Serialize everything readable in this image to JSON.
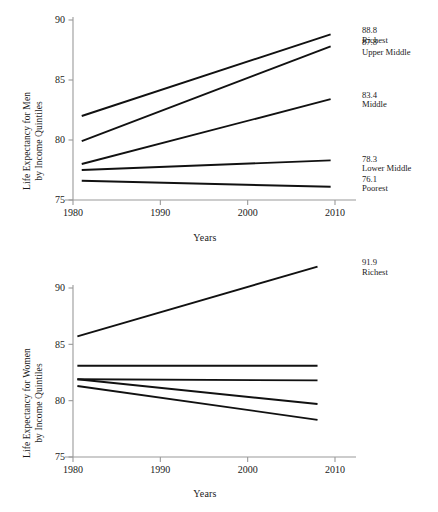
{
  "chart_data": [
    {
      "id": "men",
      "type": "line",
      "title": "",
      "xlabel": "Years",
      "ylabel": "Life Expectancy for Men by Income Quintiles",
      "ylabel_line1": "Life Expectancy for Men",
      "ylabel_line2": "by Income Quintiles",
      "xlim": [
        1978.5,
        2013.5
      ],
      "ylim": [
        74.3,
        90.6
      ],
      "xticks": [
        1980,
        1990,
        2000,
        2010
      ],
      "xticklabels": [
        "1980",
        "1990",
        "2000",
        "2010"
      ],
      "yticks": [
        75,
        80,
        85,
        90
      ],
      "yticklabels": [
        "75",
        "80",
        "85",
        "90"
      ],
      "grid": false,
      "legend": "right-end-labels",
      "series": [
        {
          "name": "Richest",
          "x": [
            1981,
            2009.5
          ],
          "y": [
            82.0,
            88.8
          ],
          "end_value": "88.8",
          "end_label": "Richest"
        },
        {
          "name": "Upper Middle",
          "x": [
            1981,
            2009.5
          ],
          "y": [
            79.9,
            87.8
          ],
          "end_value": "87.8",
          "end_label": "Upper Middle"
        },
        {
          "name": "Middle",
          "x": [
            1981,
            2009.5
          ],
          "y": [
            78.0,
            83.4
          ],
          "end_value": "83.4",
          "end_label": "Middle"
        },
        {
          "name": "Lower Middle",
          "x": [
            1981,
            2009.5
          ],
          "y": [
            77.5,
            78.3
          ],
          "end_value": "78.3",
          "end_label": "Lower Middle"
        },
        {
          "name": "Poorest",
          "x": [
            1981,
            2009.5
          ],
          "y": [
            76.6,
            76.1
          ],
          "end_value": "76.1",
          "end_label": "Poorest"
        }
      ]
    },
    {
      "id": "women",
      "type": "line",
      "title": "",
      "xlabel": "Years",
      "ylabel": "Life Expectancy for Women by Income Quintiles",
      "ylabel_line1": "Life Expectancy for Women",
      "ylabel_line2": "by Income Quintiles",
      "xlim": [
        1978.5,
        2013.5
      ],
      "ylim": [
        74.4,
        92.6
      ],
      "xticks": [
        1980,
        1990,
        2000,
        2010
      ],
      "xticklabels": [
        "1980",
        "1990",
        "2000",
        "2010"
      ],
      "yticks": [
        75,
        80,
        85,
        90
      ],
      "yticklabels": [
        "75",
        "80",
        "85",
        "90"
      ],
      "grid": false,
      "legend": "right-end-labels",
      "series": [
        {
          "name": "Richest",
          "x": [
            1980.5,
            2008
          ],
          "y": [
            85.7,
            91.9
          ],
          "end_value": "91.9",
          "end_label": "Richest"
        },
        {
          "name": "Upper Middle",
          "x": [
            1980.5,
            2008
          ],
          "y": [
            83.1,
            83.1
          ],
          "end_value": "83.1",
          "end_label": "Upper Middle"
        },
        {
          "name": "Middle",
          "x": [
            1980.5,
            2008
          ],
          "y": [
            81.9,
            81.8
          ],
          "end_value": "81.9",
          "end_label": "Middle"
        },
        {
          "name": "Lower Middle",
          "x": [
            1980.5,
            2008
          ],
          "y": [
            81.9,
            79.7
          ],
          "end_value": "79.7",
          "end_label": "Lower Middle"
        },
        {
          "name": "Poorest",
          "x": [
            1980.5,
            2008
          ],
          "y": [
            81.3,
            78.3
          ],
          "end_value": "78.3",
          "end_label": "Poorest"
        }
      ]
    }
  ],
  "style": {
    "line_color": "#111111",
    "axis_color": "#9a9a9a",
    "text_color": "#1a1a1a",
    "background": "#ffffff"
  },
  "men": {
    "ylabel_line1": "Life Expectancy for Men",
    "ylabel_line2": "by Income Quintiles",
    "xlabel": "Years",
    "yticks": [
      "90",
      "85",
      "80",
      "75"
    ],
    "xticks": [
      "1980",
      "1990",
      "2000",
      "2010"
    ],
    "annotations": [
      {
        "value": "88.8",
        "label": "Richest"
      },
      {
        "value": "87.8",
        "label": "Upper Middle"
      },
      {
        "value": "83.4",
        "label": "Middle"
      },
      {
        "value": "78.3",
        "label": "Lower Middle"
      },
      {
        "value": "76.1",
        "label": "Poorest"
      }
    ]
  },
  "women": {
    "ylabel_line1": "Life Expectancy for Women",
    "ylabel_line2": "by Income Quintiles",
    "xlabel": "Years",
    "yticks": [
      "90",
      "85",
      "80",
      "75"
    ],
    "xticks": [
      "1980",
      "1990",
      "2000",
      "2010"
    ],
    "annotations": [
      {
        "value": "91.9",
        "label": "Richest"
      },
      {
        "value": "83.1",
        "label": "Upper Middle"
      },
      {
        "value": "81.9",
        "label": "Middle"
      },
      {
        "value": "79.7",
        "label": "Lower Middle"
      },
      {
        "value": "78.3",
        "label": "Poorest"
      }
    ]
  }
}
